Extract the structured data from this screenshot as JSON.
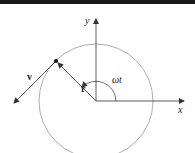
{
  "diagram": {
    "labels": {
      "y_axis": "y",
      "x_axis": "x",
      "velocity": "v",
      "radius": "r",
      "angle": "ωt"
    },
    "colors": {
      "axes": "#333333",
      "circle": "#999999",
      "vectors": "#333333",
      "point": "#111111",
      "top_bar": "#1a1a1a"
    }
  }
}
